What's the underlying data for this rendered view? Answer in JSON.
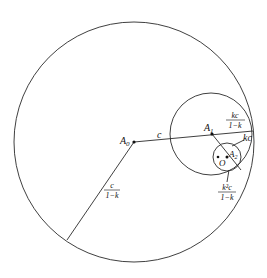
{
  "diagram": {
    "colors": {
      "stroke": "#2a2a2a",
      "text": "#111111",
      "background": "#ffffff"
    },
    "circles": [
      {
        "name": "outer-circle",
        "cx": 134,
        "cy": 142,
        "r": 120
      },
      {
        "name": "middle-circle",
        "cx": 211,
        "cy": 134,
        "r": 41
      },
      {
        "name": "inner-circle",
        "cx": 227,
        "cy": 157,
        "r": 14
      }
    ],
    "points": {
      "A0": {
        "label": "A",
        "sub": "0",
        "x": 134,
        "y": 142
      },
      "A1": {
        "label": "A",
        "sub": "1",
        "x": 212,
        "y": 134
      },
      "A2": {
        "label": "A",
        "sub": "2",
        "x": 227,
        "y": 157
      },
      "O": {
        "label": "O",
        "x": 218,
        "y": 157
      }
    },
    "labels": {
      "c": "c",
      "kc": "kc",
      "frac_outer": {
        "num": "c",
        "den": "1−k"
      },
      "frac_middle": {
        "num": "kc",
        "den": "1−k"
      },
      "frac_inner": {
        "num": "k²c",
        "den": "1−k"
      }
    }
  }
}
